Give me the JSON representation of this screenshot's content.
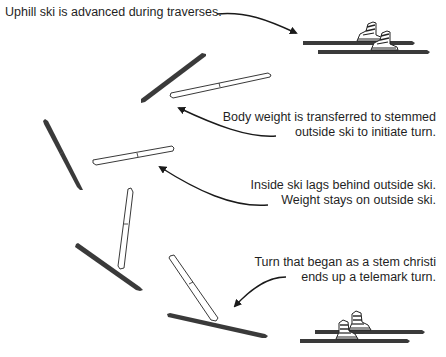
{
  "diagram": {
    "captions": {
      "uphill": {
        "lines": [
          "Uphill ski is advanced during traverses."
        ]
      },
      "body_weight": {
        "lines": [
          "Body weight is transferred to stemmed",
          "outside ski to initiate turn."
        ]
      },
      "inside_ski": {
        "lines": [
          "Inside ski lags behind outside ski.",
          "Weight stays on outside ski."
        ]
      },
      "turn": {
        "lines": [
          "Turn that began as a stem christi",
          "ends up a telemark turn."
        ]
      }
    },
    "colors": {
      "weighted_ski": "#3a3a3a",
      "unweighted_ski_fill": "#ffffff",
      "unweighted_ski_outline": "#222222",
      "arrow": "#1a1a1a",
      "text": "#1f1f1f"
    },
    "legend_semantics": {
      "dark_ski": "weighted ski",
      "white_ski": "unweighted ski"
    }
  }
}
